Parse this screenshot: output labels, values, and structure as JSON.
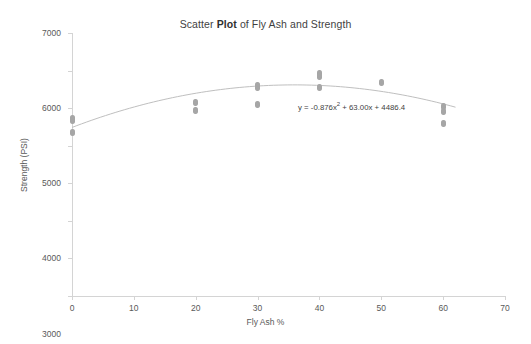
{
  "chart_data": {
    "type": "scatter",
    "title": "Scatter Plot of Fly Ash and Strength",
    "title_part_plain_1": "Scatter ",
    "title_part_bold": "Plot",
    "title_part_plain_2": " of Fly Ash and Strength",
    "xlabel": "Fly Ash %",
    "ylabel": "Strength (PSI)",
    "xlim": [
      0,
      70
    ],
    "ylim": [
      0,
      7000
    ],
    "xticks": [
      0,
      10,
      20,
      30,
      40,
      50,
      60,
      70
    ],
    "yticks": [
      0,
      1000,
      2000,
      3000,
      4000,
      5000,
      6000,
      7000
    ],
    "grid": false,
    "legend": "none",
    "marker_color": "#a6a6a6",
    "trendline_color": "#bfbfbf",
    "trendline_type": "polynomial-order-2",
    "annotation": "y = -0.876x² + 63.00x + 4486.4",
    "annotation_coefficients": {
      "a": -0.876,
      "b": 63.0,
      "c": 4486.4
    },
    "points": [
      {
        "x": 0,
        "y": 4720
      },
      {
        "x": 0,
        "y": 4680
      },
      {
        "x": 0,
        "y": 4350
      },
      {
        "x": 20,
        "y": 5150
      },
      {
        "x": 20,
        "y": 4940
      },
      {
        "x": 30,
        "y": 5600
      },
      {
        "x": 30,
        "y": 5560
      },
      {
        "x": 30,
        "y": 5100
      },
      {
        "x": 40,
        "y": 5930
      },
      {
        "x": 40,
        "y": 5850
      },
      {
        "x": 40,
        "y": 5560
      },
      {
        "x": 50,
        "y": 5670
      },
      {
        "x": 60,
        "y": 5050
      },
      {
        "x": 60,
        "y": 4900
      },
      {
        "x": 60,
        "y": 4600
      }
    ]
  }
}
